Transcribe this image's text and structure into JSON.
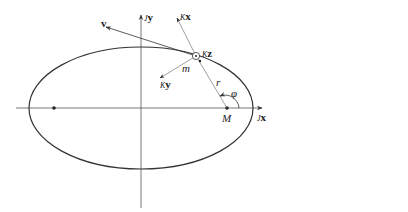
{
  "figure": {
    "type": "orbital-ellipse-diagram",
    "colors": {
      "line": "#333333",
      "thin_line": "#777777",
      "background": "#ffffff"
    },
    "ellipse": {
      "cx": 141,
      "cy": 108,
      "rx": 112,
      "ry": 61
    },
    "axes": {
      "x": {
        "label_prefix": "J",
        "label": "x",
        "from": [
          16,
          108
        ],
        "to": [
          262,
          108
        ]
      },
      "y": {
        "label_prefix": "J",
        "label": "y",
        "from": [
          141,
          208
        ],
        "to": [
          141,
          15
        ]
      }
    },
    "foci": {
      "main": {
        "label": "M",
        "x": 227,
        "y": 108
      },
      "other": {
        "x": 54,
        "y": 108
      }
    },
    "body": {
      "label": "m",
      "x": 196,
      "y": 56
    },
    "vectors": {
      "v": {
        "label": "v",
        "to": [
          106,
          27
        ]
      },
      "kx": {
        "label_prefix": "K",
        "label": "x",
        "to": [
          177,
          18
        ]
      },
      "ky": {
        "label_prefix": "K",
        "label": "y",
        "to": [
          160,
          78
        ]
      },
      "kz": {
        "label_prefix": "K",
        "label": "z"
      }
    },
    "radius": {
      "label": "r"
    },
    "angle": {
      "label": "φ"
    }
  }
}
